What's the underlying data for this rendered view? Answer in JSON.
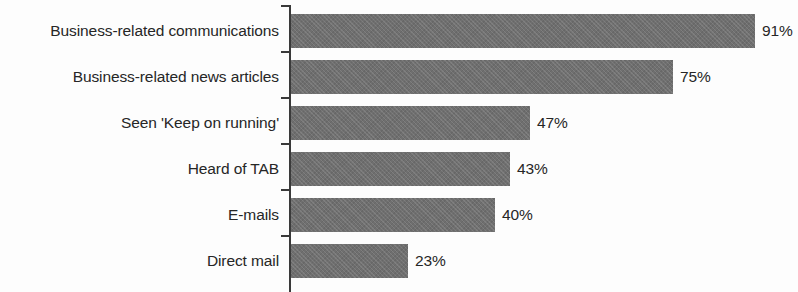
{
  "chart_data": {
    "type": "bar",
    "orientation": "horizontal",
    "title": "",
    "subtitle": "",
    "xlabel": "",
    "ylabel": "",
    "xlim": [
      0,
      100
    ],
    "grid": false,
    "legend": null,
    "value_suffix": "%",
    "categories": [
      "Business-related communications",
      "Business-related news articles",
      "Seen 'Keep on running'",
      "Heard of TAB",
      "E-mails",
      "Direct mail"
    ],
    "values": [
      91,
      75,
      47,
      43,
      40,
      23
    ],
    "value_labels": [
      "91%",
      "75%",
      "47%",
      "43%",
      "40%",
      "23%"
    ],
    "series": [
      {
        "name": "",
        "values": [
          91,
          75,
          47,
          43,
          40,
          23
        ]
      }
    ],
    "colors": {
      "bar_fill": "#6f6f6f",
      "axis": "#3a3a3a",
      "text": "#262626",
      "background": "#fdfdfd"
    }
  },
  "axis": {
    "tick_count": 5
  }
}
